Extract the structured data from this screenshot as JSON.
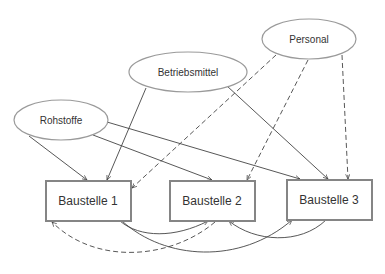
{
  "diagram": {
    "resources": [
      {
        "id": "rohstoffe",
        "label": "Rohstoffe"
      },
      {
        "id": "betriebsmittel",
        "label": "Betriebsmittel"
      },
      {
        "id": "personal",
        "label": "Personal"
      }
    ],
    "sites": [
      {
        "id": "baustelle1",
        "label": "Baustelle 1"
      },
      {
        "id": "baustelle2",
        "label": "Baustelle 2"
      },
      {
        "id": "baustelle3",
        "label": "Baustelle 3"
      }
    ],
    "edges": [
      {
        "from": "rohstoffe",
        "to": "baustelle1",
        "style": "solid"
      },
      {
        "from": "rohstoffe",
        "to": "baustelle2",
        "style": "solid"
      },
      {
        "from": "rohstoffe",
        "to": "baustelle3",
        "style": "solid"
      },
      {
        "from": "betriebsmittel",
        "to": "baustelle1",
        "style": "solid"
      },
      {
        "from": "betriebsmittel",
        "to": "baustelle3",
        "style": "solid"
      },
      {
        "from": "personal",
        "to": "baustelle1",
        "style": "dashed"
      },
      {
        "from": "personal",
        "to": "baustelle2",
        "style": "dashed"
      },
      {
        "from": "personal",
        "to": "baustelle3",
        "style": "dashed"
      },
      {
        "from": "baustelle1",
        "to": "baustelle2",
        "style": "solid"
      },
      {
        "from": "baustelle1",
        "to": "baustelle3",
        "style": "solid"
      },
      {
        "from": "baustelle3",
        "to": "baustelle2",
        "style": "solid"
      },
      {
        "from": "baustelle2",
        "to": "baustelle1",
        "style": "dashed"
      }
    ]
  }
}
